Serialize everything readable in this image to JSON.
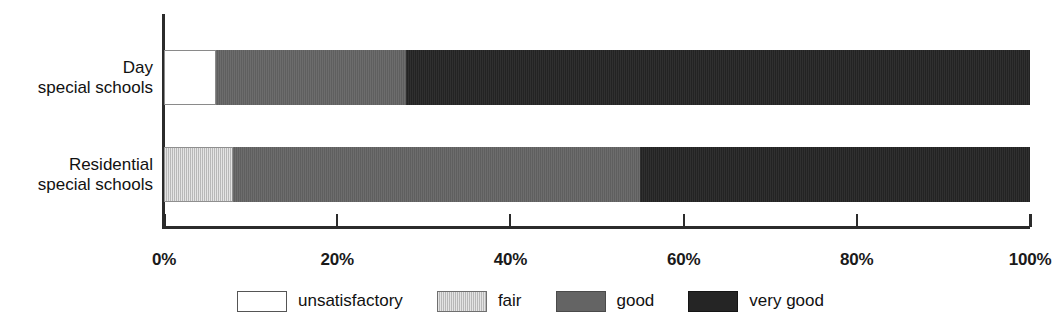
{
  "chart_data": {
    "type": "bar",
    "orientation": "horizontal",
    "stacked": true,
    "normalized_percent": true,
    "title": "",
    "subtitle": "",
    "xlabel": "",
    "ylabel": "",
    "xlim": [
      0,
      100
    ],
    "grid": false,
    "legend_position": "bottom",
    "categories": [
      "Day special schools",
      "Residential special schools"
    ],
    "category_lines": [
      [
        "Day",
        "special schools"
      ],
      [
        "Residential",
        "special schools"
      ]
    ],
    "tick_labels": [
      "0%",
      "20%",
      "40%",
      "60%",
      "80%",
      "100%"
    ],
    "tick_values": [
      0,
      20,
      40,
      60,
      80,
      100
    ],
    "series": [
      {
        "name": "unsatisfactory",
        "color": "#ffffff",
        "values": [
          6,
          0
        ]
      },
      {
        "name": "fair",
        "color": "#c3c3c3",
        "values": [
          0,
          8
        ]
      },
      {
        "name": "good",
        "color": "#646464",
        "values": [
          22,
          47
        ]
      },
      {
        "name": "very good",
        "color": "#252525",
        "values": [
          72,
          45
        ]
      }
    ],
    "bars": [
      {
        "category": "Day special schools",
        "segments": [
          {
            "label": "unsatisfactory",
            "value": 6,
            "start": 0,
            "end": 6,
            "style": "unsatisfactory"
          },
          {
            "label": "good",
            "value": 22,
            "start": 6,
            "end": 28,
            "style": "good"
          },
          {
            "label": "very good",
            "value": 72,
            "start": 28,
            "end": 100,
            "style": "verygood"
          }
        ]
      },
      {
        "category": "Residential special schools",
        "segments": [
          {
            "label": "fair",
            "value": 8,
            "start": 0,
            "end": 8,
            "style": "fair"
          },
          {
            "label": "good",
            "value": 47,
            "start": 8,
            "end": 55,
            "style": "good"
          },
          {
            "label": "very good",
            "value": 45,
            "start": 55,
            "end": 100,
            "style": "verygood"
          }
        ]
      }
    ],
    "legend": [
      {
        "label": "unsatisfactory",
        "style": "unsatisfactory"
      },
      {
        "label": "fair",
        "style": "fair"
      },
      {
        "label": "good",
        "style": "good"
      },
      {
        "label": "very good",
        "style": "verygood"
      }
    ]
  },
  "layout": {
    "plot_left_px": 164,
    "plot_right_px": 1030,
    "bar_tops_px": [
      50,
      147
    ],
    "bar_height_px": 55
  }
}
